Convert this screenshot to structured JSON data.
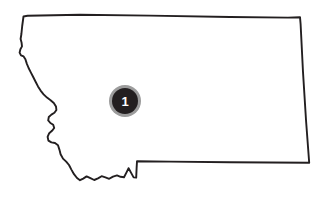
{
  "map": {
    "region_name": "Montana",
    "shape_type": "state-outline",
    "background_color": "#ffffff",
    "outline_color": "#231f20",
    "outline_width": 1.9,
    "canvas": {
      "width": 329,
      "height": 198
    },
    "outline_path": "M 23.5,16.5 L 27.5,15.8 L 80,14.8 L 150,15.6 L 230,17.0 L 288,17.6 L 300.0,17.2 L 300.6,24 L 303,72 L 306,120 L 309.2,162.8 L 230,162.2 L 170,161.6 L 137.0,161.2 L 136.6,168.4 L 136.2,177.6 L 133.6,177.4 L 131.0,172.6 L 128.6,168.2 L 126.4,172.6 L 124.0,177.2 L 120.6,176.8 L 117.0,175.4 L 113.0,176.6 L 109.2,178.8 L 105.4,177.4 L 101.6,176.2 L 98.0,178.4 L 94.2,180.0 L 90.4,178.2 L 86.6,176.4 L 83.2,178.6 L 80.0,180.2 L 77.0,178.0 L 74.0,174.2 L 71.4,169.6 L 69.0,165.0 L 66.2,161.6 L 63.0,158.6 L 60.6,154.2 L 59.4,149.6 L 58.0,145.2 L 55.0,143.0 L 51.4,142.4 L 48.4,140.6 L 47.6,136.8 L 49.2,133.2 L 52.0,130.8 L 54.2,128.0 L 53.2,124.8 L 50.4,123.0 L 48.2,120.4 L 48.8,117.0 L 51.4,114.6 L 54.4,112.8 L 56.4,110.0 L 56.0,106.4 L 53.8,103.0 L 50.6,100.2 L 47.0,97.6 L 43.6,94.4 L 40.6,90.6 L 38.0,86.4 L 35.6,81.8 L 33.2,77.0 L 30.8,72.4 L 28.6,68.0 L 26.8,63.6 L 25.4,59.2 L 23.6,56.4 L 21.0,55.4 L 19.6,52.6 L 20.4,49.2 L 22.0,46.4 L 21.6,42.8 L 20.6,39.0 L 21.4,34.0 L 22.2,26.0 Z",
    "markers": [
      {
        "id": "marker-1",
        "label": "1",
        "cx": 125,
        "cy": 101,
        "outer_radius": 16,
        "inner_radius": 13,
        "ring_color": "#9c9c9c",
        "disc_color": "#231f20",
        "label_color": "#ffffff"
      }
    ]
  }
}
